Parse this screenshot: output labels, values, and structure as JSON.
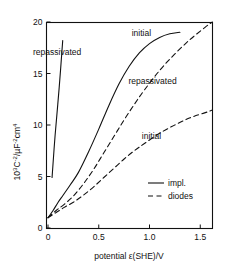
{
  "chart_data": {
    "type": "line",
    "title": "",
    "xlabel": "potential ε(SHE)/V",
    "ylabel": "10³C⁻²/µF⁻²cm⁴",
    "ylabel_parts": {
      "base1": "10",
      "exp1": "3",
      "base2": "C",
      "exp2": "-2",
      "slash": "/µF",
      "exp3": "-2",
      "base3": "cm",
      "exp4": "4"
    },
    "xlim": [
      -0.06,
      1.62
    ],
    "ylim": [
      0,
      20
    ],
    "xticks": [
      0,
      0.5,
      1.0,
      1.5
    ],
    "xticklabels": [
      "0",
      "0.5",
      "1.0",
      "1.5"
    ],
    "yticks": [
      0,
      5,
      10,
      15,
      20
    ],
    "yticklabels": [
      "0",
      "5",
      "10",
      "15",
      "20"
    ],
    "grid": false,
    "legend_position": "inside-lower-right",
    "legend": [
      {
        "label": "impl.",
        "style": "solid"
      },
      {
        "label": "diodes",
        "style": "dashed"
      }
    ],
    "annotations": [
      {
        "text": "repassivated",
        "x": 0.09,
        "y": 16.8,
        "series": "impl-repassivated"
      },
      {
        "text": "initial",
        "x": 0.92,
        "y": 18.6,
        "series": "impl-initial"
      },
      {
        "text": "repassivated",
        "x": 1.03,
        "y": 14.0,
        "series": "diodes-repassivated"
      },
      {
        "text": "initial",
        "x": 1.02,
        "y": 8.6,
        "series": "diodes-initial"
      }
    ],
    "series": [
      {
        "name": "impl-repassivated",
        "style": "solid",
        "points": [
          [
            0.04,
            4.9
          ],
          [
            0.07,
            9.0
          ],
          [
            0.11,
            13.6
          ],
          [
            0.145,
            18.2
          ]
        ]
      },
      {
        "name": "impl-initial",
        "style": "solid",
        "points": [
          [
            0.0,
            1.0
          ],
          [
            0.05,
            1.7
          ],
          [
            0.1,
            2.5
          ],
          [
            0.15,
            3.2
          ],
          [
            0.22,
            4.2
          ],
          [
            0.3,
            5.4
          ],
          [
            0.4,
            7.4
          ],
          [
            0.5,
            9.6
          ],
          [
            0.6,
            11.9
          ],
          [
            0.7,
            14.0
          ],
          [
            0.8,
            15.7
          ],
          [
            0.9,
            17.0
          ],
          [
            1.0,
            17.9
          ],
          [
            1.1,
            18.5
          ],
          [
            1.2,
            18.85
          ],
          [
            1.3,
            19.0
          ]
        ]
      },
      {
        "name": "diodes-repassivated",
        "style": "dashed",
        "points": [
          [
            0.0,
            1.0
          ],
          [
            0.08,
            1.7
          ],
          [
            0.16,
            2.3
          ],
          [
            0.25,
            3.1
          ],
          [
            0.35,
            4.3
          ],
          [
            0.45,
            5.7
          ],
          [
            0.55,
            7.3
          ],
          [
            0.65,
            8.9
          ],
          [
            0.75,
            10.5
          ],
          [
            0.85,
            12.0
          ],
          [
            0.95,
            13.4
          ],
          [
            1.1,
            15.3
          ],
          [
            1.25,
            16.9
          ],
          [
            1.4,
            18.3
          ],
          [
            1.55,
            19.5
          ],
          [
            1.62,
            20.0
          ]
        ]
      },
      {
        "name": "diodes-initial",
        "style": "dashed",
        "points": [
          [
            0.0,
            1.0
          ],
          [
            0.08,
            1.5
          ],
          [
            0.16,
            2.0
          ],
          [
            0.25,
            2.5
          ],
          [
            0.35,
            3.2
          ],
          [
            0.45,
            4.0
          ],
          [
            0.55,
            4.9
          ],
          [
            0.65,
            5.8
          ],
          [
            0.75,
            6.7
          ],
          [
            0.85,
            7.5
          ],
          [
            0.95,
            8.2
          ],
          [
            1.1,
            9.2
          ],
          [
            1.25,
            10.0
          ],
          [
            1.4,
            10.7
          ],
          [
            1.55,
            11.2
          ],
          [
            1.62,
            11.45
          ]
        ]
      }
    ]
  }
}
